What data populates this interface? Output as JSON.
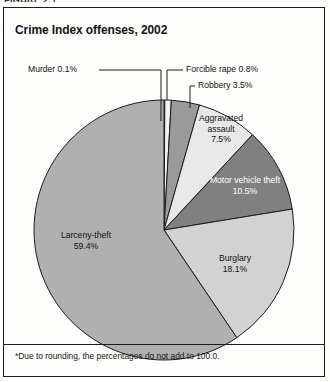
{
  "figure": {
    "caption": "FIGURE 2.1",
    "title": "Crime Index offenses, 2002",
    "footnote": "*Due to rounding, the percentages do not add to 100.0."
  },
  "labels": {
    "murder": "Murder 0.1%",
    "forcible_rape": "Forcible rape 0.8%",
    "robbery": "Robbery 3.5%",
    "aggravated_assault_l1": "Aggravated",
    "aggravated_assault_l2": "assault",
    "aggravated_assault_l3": "7.5%",
    "motor_vehicle_theft_l1": "Motor vehicle theft",
    "motor_vehicle_theft_l2": "10.5%",
    "burglary_l1": "Burglary",
    "burglary_l2": "18.1%",
    "larceny_theft_l1": "Larceny-theft",
    "larceny_theft_l2": "59.4%"
  },
  "chart_data": {
    "type": "pie",
    "title": "Crime Index offenses, 2002",
    "note": "*Due to rounding, the percentages do not add to 100.0.",
    "unit": "percent",
    "start_angle_deg": 0,
    "direction": "clockwise",
    "legend": "none-inline-labels",
    "categories": [
      "Murder",
      "Forcible rape",
      "Robbery",
      "Aggravated assault",
      "Motor vehicle theft",
      "Burglary",
      "Larceny-theft"
    ],
    "values": [
      0.1,
      0.8,
      3.5,
      7.5,
      10.5,
      18.1,
      59.4
    ],
    "colors": [
      "#b9b9b9",
      "#f2f2f2",
      "#9a9a9a",
      "#e8e8e8",
      "#808080",
      "#d2d2d2",
      "#b0b0b0"
    ],
    "label_colors": [
      "#121212",
      "#121212",
      "#121212",
      "#121212",
      "#ffffff",
      "#121212",
      "#121212"
    ],
    "slices": [
      {
        "name": "Murder",
        "value": 0.1,
        "label": "Murder 0.1%",
        "color": "#b9b9b9",
        "label_style": "callout"
      },
      {
        "name": "Forcible rape",
        "value": 0.8,
        "label": "Forcible rape 0.8%",
        "color": "#f2f2f2",
        "label_style": "callout"
      },
      {
        "name": "Robbery",
        "value": 3.5,
        "label": "Robbery 3.5%",
        "color": "#9a9a9a",
        "label_style": "callout"
      },
      {
        "name": "Aggravated assault",
        "value": 7.5,
        "label": "Aggravated assault 7.5%",
        "color": "#e8e8e8",
        "label_style": "inside"
      },
      {
        "name": "Motor vehicle theft",
        "value": 10.5,
        "label": "Motor vehicle theft 10.5%",
        "color": "#808080",
        "label_style": "inside"
      },
      {
        "name": "Burglary",
        "value": 18.1,
        "label": "Burglary 18.1%",
        "color": "#d2d2d2",
        "label_style": "inside"
      },
      {
        "name": "Larceny-theft",
        "value": 59.4,
        "label": "Larceny-theft 59.4%",
        "color": "#b0b0b0",
        "label_style": "inside"
      }
    ],
    "total": 99.9
  }
}
